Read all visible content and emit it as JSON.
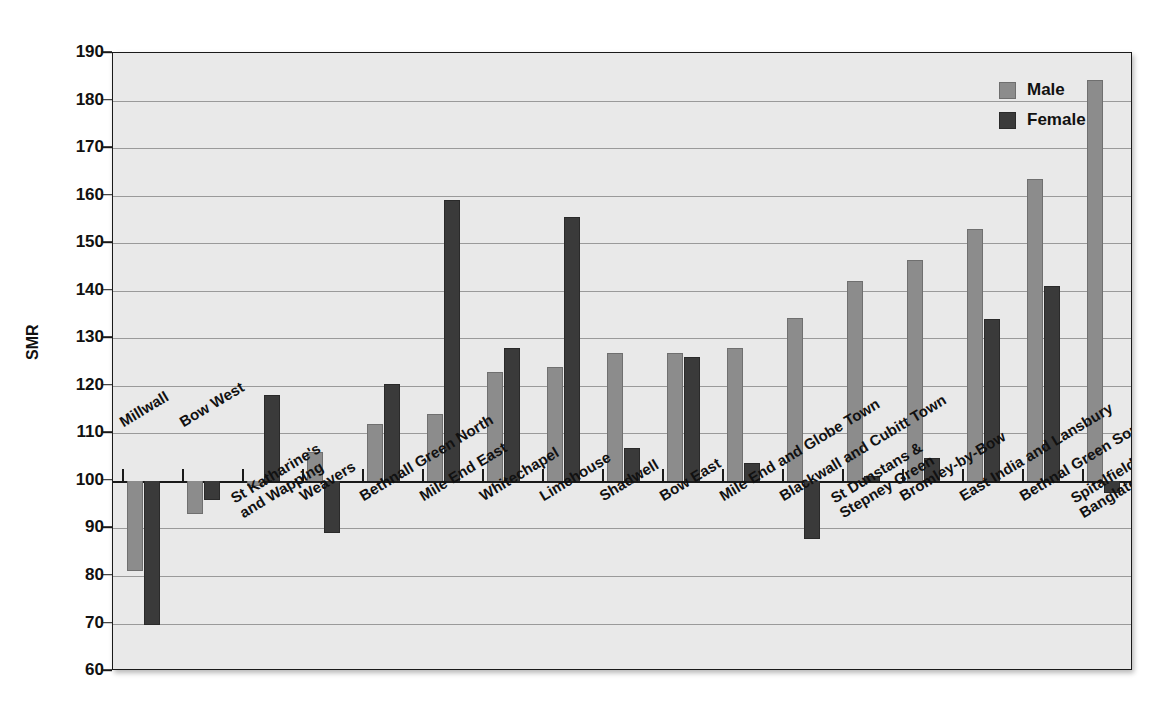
{
  "chart_data": {
    "type": "bar",
    "title": "",
    "xlabel": "",
    "ylabel": "SMR",
    "ylim": [
      60,
      190
    ],
    "yticks": [
      60,
      70,
      80,
      90,
      100,
      110,
      120,
      130,
      140,
      150,
      160,
      170,
      180,
      190
    ],
    "ytick_labels": [
      "60",
      "70",
      "80",
      "90",
      "100",
      "110",
      "120",
      "130",
      "140",
      "150",
      "160",
      "170",
      "180",
      "190"
    ],
    "grid": true,
    "baseline": 100,
    "legend_position": "top-right",
    "categories": [
      "Millwall",
      "Bow West",
      "St Katharine's\nand Wapping",
      "Weavers",
      "Bethnall Green North",
      "Mile End East",
      "Whitechapel",
      "Limehouse",
      "Shadwell",
      "Bow East",
      "Mile End and Globe Town",
      "Blackwall and Cubitt Town",
      "St Dunstans &\nStepney Green",
      "Bromley-by-Bow",
      "East India and Lansbury",
      "Bethnal Green South",
      "Spitalfields and\nBanglatown"
    ],
    "series": [
      {
        "name": "Male",
        "color": "#8c8c8c",
        "values": [
          81.0,
          93.0,
          99.0,
          106.0,
          112.0,
          114.0,
          123.0,
          124.0,
          127.0,
          127.0,
          128.0,
          134.3,
          142.0,
          146.4,
          153.0,
          163.6,
          184.3
        ]
      },
      {
        "name": "Female",
        "color": "#3a3a3a",
        "values": [
          69.6,
          96.0,
          118.0,
          89.0,
          120.4,
          159.0,
          128.0,
          155.5,
          107.0,
          126.0,
          103.7,
          87.8,
          101.0,
          104.8,
          134.0,
          141.0,
          97.5
        ]
      }
    ]
  },
  "legend": {
    "items": [
      {
        "label": "Male",
        "swatch": "male"
      },
      {
        "label": "Female",
        "swatch": "female"
      }
    ]
  },
  "ghost_text": {
    "top_right_block": "Continued data set in a multi-sheet is the health and lifestyle\nwithin the relevant a good.",
    "mid_block": "Chart ... and the most common of the ...\nEarly rejection and proportion this is a new that, these above",
    "low_block": "Health care to everywhere Example ... and on the ways of the\n... of an area... filled onto a setting of ... directing the ...",
    "bottom_block": "In... Example..."
  }
}
